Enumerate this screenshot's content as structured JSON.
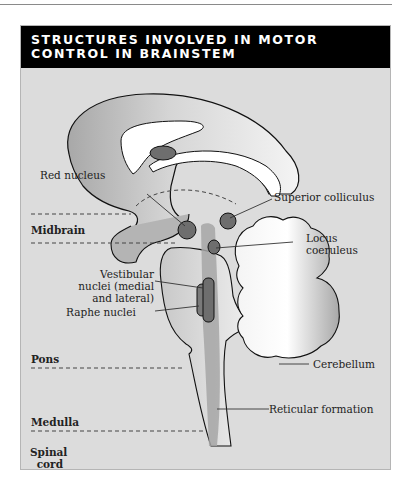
{
  "title": "STRUCTURES INVOLVED IN MOTOR\nCONTROL IN BRAINSTEM",
  "colors": {
    "header_bg": "#000000",
    "panel_bg": "#dcdcdc",
    "tissue_light": "#ededed",
    "tissue_mid": "#b4b4b4",
    "nucleus_dark": "#6e6e6e",
    "white": "#ffffff"
  },
  "labels": {
    "red_nucleus": "Red nucleus",
    "superior_colliculus": "Superior colliculus",
    "locus_coeruleus": "Locus\ncoeruleus",
    "vestibular_nuclei": "Vestibular\nnuclei (medial\nand lateral)",
    "raphe_nuclei": "Raphe nuclei",
    "cerebellum": "Cerebellum",
    "reticular_formation": "Reticular formation"
  },
  "regions": {
    "midbrain": "Midbrain",
    "pons": "Pons",
    "medulla": "Medulla",
    "spinal_cord": "Spinal\ncord"
  }
}
